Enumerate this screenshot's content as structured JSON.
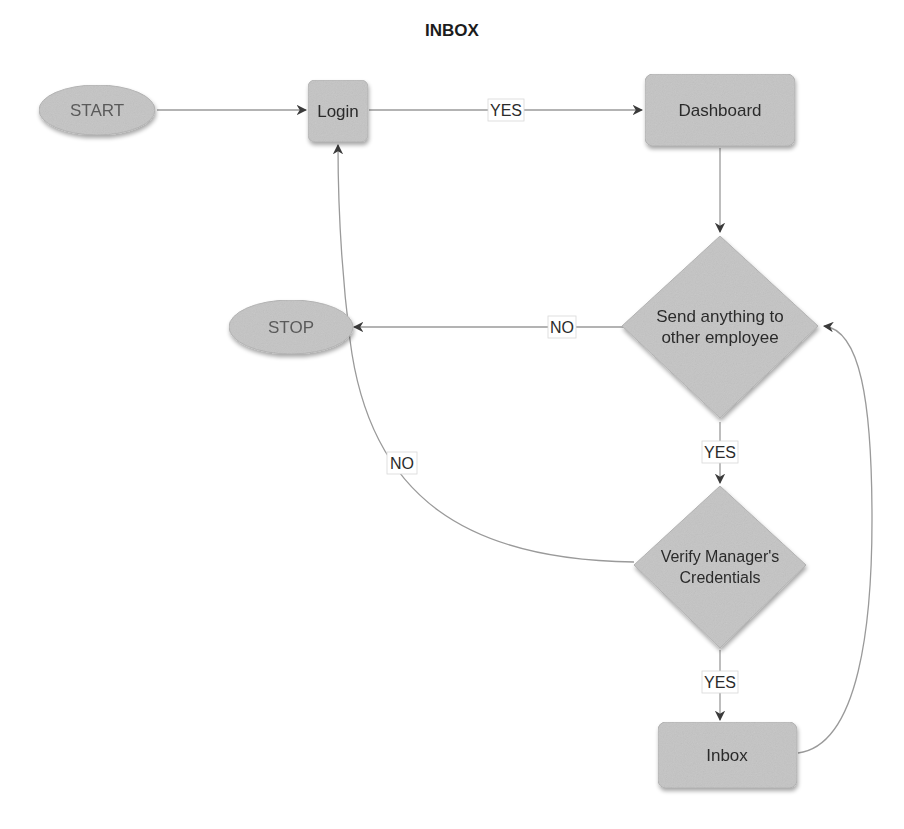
{
  "title": "INBOX",
  "colors": {
    "node_fill": "#c4c4c4",
    "node_stroke": "#b2b2b2",
    "edge": "#9a9a9a",
    "text": "#2b2b2b",
    "background": "#ffffff"
  },
  "nodes": {
    "start": {
      "label": "START",
      "shape": "ellipse"
    },
    "login": {
      "label": "Login",
      "shape": "rounded-rect"
    },
    "dashboard": {
      "label": "Dashboard",
      "shape": "rounded-rect"
    },
    "send_decision": {
      "label_line1": "Send anything to",
      "label_line2": "other employee",
      "shape": "diamond"
    },
    "stop": {
      "label": "STOP",
      "shape": "ellipse"
    },
    "verify_decision": {
      "label_line1": "Verify Manager's",
      "label_line2": "Credentials",
      "shape": "diamond"
    },
    "inbox": {
      "label": "Inbox",
      "shape": "rounded-rect"
    }
  },
  "edges": {
    "start_to_login": {
      "from": "START",
      "to": "Login",
      "label": ""
    },
    "login_to_dashboard": {
      "from": "Login",
      "to": "Dashboard",
      "label": "YES"
    },
    "dashboard_to_send": {
      "from": "Dashboard",
      "to": "Send anything to other employee",
      "label": ""
    },
    "send_to_stop": {
      "from": "Send anything to other employee",
      "to": "STOP",
      "label": "NO"
    },
    "send_to_verify": {
      "from": "Send anything to other employee",
      "to": "Verify Manager's Credentials",
      "label": "YES"
    },
    "verify_to_login": {
      "from": "Verify Manager's Credentials",
      "to": "Login",
      "label": "NO"
    },
    "verify_to_inbox": {
      "from": "Verify Manager's Credentials",
      "to": "Inbox",
      "label": "YES"
    },
    "inbox_to_send": {
      "from": "Inbox",
      "to": "Send anything to other employee",
      "label": ""
    }
  }
}
